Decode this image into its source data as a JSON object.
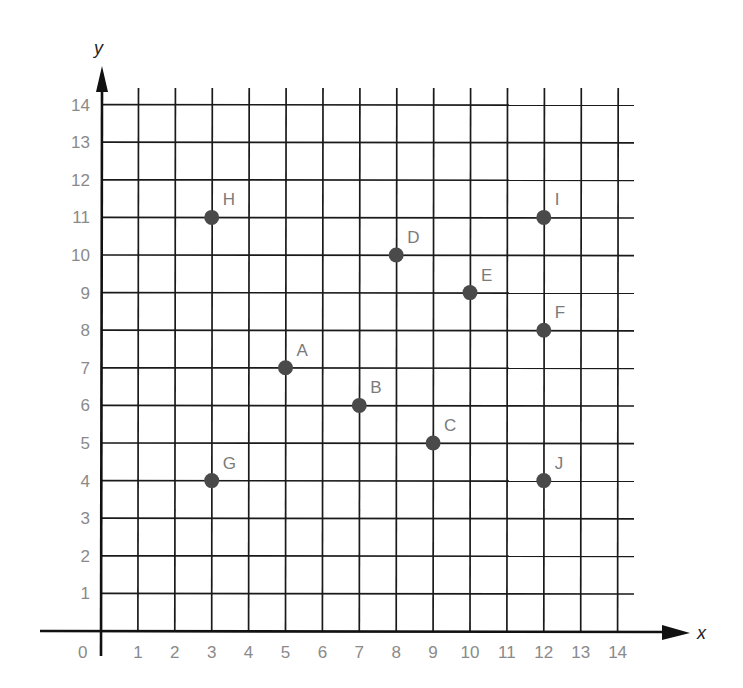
{
  "chart_data": {
    "type": "scatter",
    "title": "",
    "xlabel": "x",
    "ylabel": "y",
    "xlim": [
      0,
      14
    ],
    "ylim": [
      0,
      14
    ],
    "grid": true,
    "legend": null,
    "x_ticks": [
      "1",
      "2",
      "3",
      "4",
      "5",
      "6",
      "7",
      "8",
      "9",
      "10",
      "11",
      "12",
      "13",
      "14"
    ],
    "y_ticks": [
      "1",
      "2",
      "3",
      "4",
      "5",
      "6",
      "7",
      "8",
      "9",
      "10",
      "11",
      "12",
      "13",
      "14"
    ],
    "origin_label": "0",
    "points": [
      {
        "label": "A",
        "x": 5,
        "y": 7
      },
      {
        "label": "B",
        "x": 7,
        "y": 6
      },
      {
        "label": "C",
        "x": 9,
        "y": 5
      },
      {
        "label": "D",
        "x": 8,
        "y": 10
      },
      {
        "label": "E",
        "x": 10,
        "y": 9
      },
      {
        "label": "F",
        "x": 12,
        "y": 8
      },
      {
        "label": "G",
        "x": 3,
        "y": 4
      },
      {
        "label": "H",
        "x": 3,
        "y": 11
      },
      {
        "label": "I",
        "x": 12,
        "y": 11
      },
      {
        "label": "J",
        "x": 12,
        "y": 4
      }
    ],
    "colors": {
      "grid": "#1a1a1a",
      "point": "#4a4a4a",
      "tick_text": "#8a8a8a",
      "point_label": "#7a7a7a"
    }
  }
}
